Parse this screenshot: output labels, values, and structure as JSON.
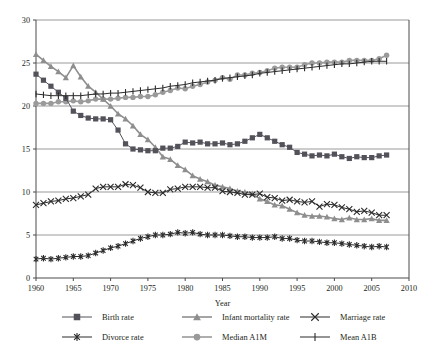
{
  "chart_data": {
    "type": "line",
    "title": "",
    "xlabel": "Year",
    "ylabel": "",
    "xlim": [
      1960,
      2010
    ],
    "ylim": [
      0,
      30
    ],
    "grid": true,
    "legend_position": "bottom",
    "xticks": [
      1960,
      1965,
      1970,
      1975,
      1980,
      1985,
      1990,
      1995,
      2000,
      2005,
      2010
    ],
    "yticks": [
      0,
      5,
      10,
      15,
      20,
      25,
      30
    ],
    "x": [
      1960,
      1961,
      1962,
      1963,
      1964,
      1965,
      1966,
      1967,
      1968,
      1969,
      1970,
      1971,
      1972,
      1973,
      1974,
      1975,
      1976,
      1977,
      1978,
      1979,
      1980,
      1981,
      1982,
      1983,
      1984,
      1985,
      1986,
      1987,
      1988,
      1989,
      1990,
      1991,
      1992,
      1993,
      1994,
      1995,
      1996,
      1997,
      1998,
      1999,
      2000,
      2001,
      2002,
      2003,
      2004,
      2005,
      2006,
      2007
    ],
    "series": [
      {
        "name": "Birth rate",
        "color": "#53525a",
        "marker": "square",
        "values": [
          23.7,
          23.0,
          22.3,
          21.6,
          20.9,
          19.4,
          18.9,
          18.6,
          18.5,
          18.5,
          18.4,
          17.2,
          15.6,
          15.0,
          14.9,
          14.8,
          14.8,
          15.1,
          15.1,
          15.3,
          15.8,
          15.7,
          15.8,
          15.6,
          15.6,
          15.7,
          15.5,
          15.6,
          15.9,
          16.3,
          16.7,
          16.3,
          15.9,
          15.5,
          15.2,
          14.6,
          14.4,
          14.2,
          14.3,
          14.2,
          14.4,
          14.1,
          13.9,
          14.1,
          14.0,
          14.0,
          14.2,
          14.3
        ]
      },
      {
        "name": "Infant mortality rate",
        "color": "#8e8e8e",
        "marker": "triangle",
        "values": [
          26.0,
          25.3,
          24.6,
          24.0,
          23.3,
          24.7,
          23.4,
          22.3,
          21.6,
          20.8,
          20.0,
          19.1,
          18.5,
          17.7,
          16.7,
          16.1,
          15.2,
          14.1,
          13.8,
          13.1,
          12.6,
          11.9,
          11.5,
          11.2,
          10.8,
          10.6,
          10.4,
          10.1,
          10.0,
          9.8,
          9.2,
          8.9,
          8.5,
          8.4,
          8.0,
          7.6,
          7.3,
          7.2,
          7.2,
          7.1,
          6.9,
          6.8,
          7.0,
          6.8,
          6.8,
          6.9,
          6.7,
          6.7
        ]
      },
      {
        "name": "Marriage rate",
        "color": "#2b2b2b",
        "marker": "x",
        "values": [
          8.5,
          8.7,
          8.9,
          9.0,
          9.2,
          9.3,
          9.5,
          9.7,
          10.4,
          10.6,
          10.6,
          10.6,
          10.9,
          10.8,
          10.5,
          10.0,
          9.9,
          9.9,
          10.3,
          10.4,
          10.6,
          10.6,
          10.6,
          10.5,
          10.5,
          10.1,
          10.0,
          9.9,
          9.7,
          9.7,
          9.8,
          9.4,
          9.3,
          9.0,
          9.1,
          8.9,
          8.8,
          8.9,
          8.3,
          8.6,
          8.5,
          8.2,
          8.0,
          7.7,
          7.8,
          7.6,
          7.3,
          7.3
        ]
      },
      {
        "name": "Divorce rate",
        "color": "#2b2b2b",
        "marker": "asterisk",
        "values": [
          2.2,
          2.3,
          2.2,
          2.3,
          2.4,
          2.5,
          2.5,
          2.6,
          2.9,
          3.2,
          3.5,
          3.7,
          4.0,
          4.3,
          4.6,
          4.8,
          5.0,
          5.0,
          5.1,
          5.3,
          5.2,
          5.3,
          5.1,
          5.0,
          5.0,
          5.0,
          4.9,
          4.8,
          4.8,
          4.7,
          4.7,
          4.7,
          4.8,
          4.6,
          4.6,
          4.4,
          4.3,
          4.3,
          4.2,
          4.1,
          4.1,
          4.0,
          3.9,
          3.8,
          3.7,
          3.6,
          3.7,
          3.6
        ]
      },
      {
        "name": "Median A1M",
        "color": "#9a9a9a",
        "marker": "circle",
        "values": [
          20.3,
          20.3,
          20.3,
          20.5,
          20.5,
          20.6,
          20.5,
          20.6,
          20.8,
          20.8,
          20.8,
          20.9,
          21.0,
          21.0,
          21.1,
          21.1,
          21.3,
          21.6,
          21.8,
          22.1,
          22.0,
          22.3,
          22.5,
          22.8,
          23.0,
          23.3,
          23.1,
          23.6,
          23.6,
          23.8,
          23.9,
          24.1,
          24.4,
          24.5,
          24.5,
          24.5,
          24.8,
          25.0,
          25.0,
          25.1,
          25.1,
          25.1,
          25.3,
          25.3,
          25.3,
          25.3,
          25.5,
          25.9
        ]
      },
      {
        "name": "Mean A1B",
        "color": "#2b2b2b",
        "marker": "plus",
        "values": [
          21.4,
          21.3,
          21.2,
          21.2,
          21.2,
          21.2,
          21.2,
          21.3,
          21.4,
          21.4,
          21.5,
          21.5,
          21.6,
          21.7,
          21.8,
          21.9,
          22.0,
          22.1,
          22.3,
          22.4,
          22.5,
          22.7,
          22.8,
          22.9,
          23.0,
          23.2,
          23.3,
          23.4,
          23.5,
          23.6,
          23.8,
          23.9,
          24.0,
          24.1,
          24.2,
          24.3,
          24.4,
          24.5,
          24.6,
          24.7,
          24.8,
          24.9,
          24.9,
          25.0,
          25.1,
          25.2,
          25.2,
          25.2
        ]
      }
    ]
  },
  "legend": {
    "row1": [
      {
        "label": "Birth rate"
      },
      {
        "label": "Infant mortality rate"
      },
      {
        "label": "Marriage rate"
      }
    ],
    "row2": [
      {
        "label": "Divorce rate"
      },
      {
        "label": "Median A1M"
      },
      {
        "label": "Mean A1B"
      }
    ]
  },
  "axes": {
    "x_title": "Year",
    "x_tick_labels": [
      "1960",
      "1965",
      "1970",
      "1975",
      "1980",
      "1985",
      "1990",
      "1995",
      "2000",
      "2005",
      "2010"
    ],
    "y_tick_labels": [
      "0",
      "5",
      "10",
      "15",
      "20",
      "25",
      "30"
    ]
  }
}
